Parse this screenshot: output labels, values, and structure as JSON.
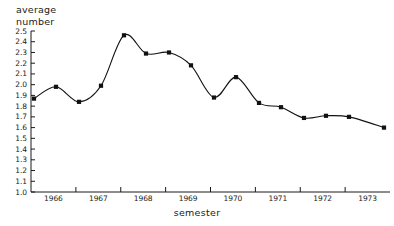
{
  "chart_data": {
    "type": "line",
    "title": "",
    "ylabel": "average\nnumber",
    "xlabel": "semester",
    "ylim": [
      1.0,
      2.5
    ],
    "ytick_step": 0.1,
    "grid": false,
    "legend": null,
    "marker": "filled-square",
    "line_color": "#111111",
    "x_tick_labels": [
      "1966",
      "1967",
      "1968",
      "1969",
      "1970",
      "1971",
      "1972",
      "1973"
    ],
    "y_tick_labels": [
      "2.5",
      "2.4",
      "2.3",
      "2.2",
      "2.1",
      "2.0",
      "1.9",
      "1.8",
      "1.7",
      "1.6",
      "1.5",
      "1.4",
      "1.3",
      "1.2",
      "1.1",
      "1.0"
    ],
    "categories": [
      "1966-1",
      "1966-2",
      "1967-1",
      "1967-2",
      "1968-1",
      "1968-2",
      "1969-1",
      "1969-2",
      "1970-1",
      "1970-2",
      "1971-1",
      "1971-2",
      "1972-1",
      "1972-2",
      "1973-1",
      "1973-2"
    ],
    "values": [
      1.87,
      1.98,
      1.84,
      1.99,
      2.46,
      2.29,
      2.3,
      2.18,
      1.88,
      2.07,
      1.83,
      1.79,
      1.69,
      1.71,
      1.7,
      1.6
    ],
    "x_pixels": [
      34,
      56,
      79,
      101,
      124,
      146,
      169,
      191,
      214,
      236,
      259,
      281,
      304,
      326,
      349,
      384
    ],
    "annotations": []
  }
}
